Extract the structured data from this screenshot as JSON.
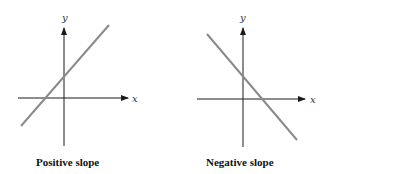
{
  "panels": [
    {
      "id": "positive",
      "caption": "Positive slope",
      "x_axis_label": "x",
      "y_axis_label": "y",
      "line_color": "#8a8a8a",
      "axis_color": "#1a1a1a"
    },
    {
      "id": "negative",
      "caption": "Negative slope",
      "x_axis_label": "x",
      "y_axis_label": "y",
      "line_color": "#8a8a8a",
      "axis_color": "#1a1a1a"
    }
  ]
}
